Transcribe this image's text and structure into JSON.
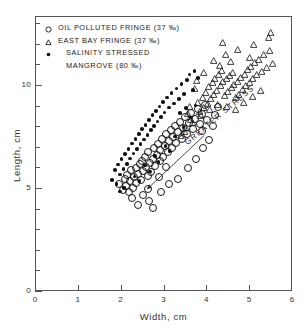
{
  "chart_data": {
    "type": "scatter",
    "title": "",
    "xlabel": "Width, cm",
    "ylabel": "Length, cm",
    "xlim": [
      0,
      6
    ],
    "ylim": [
      0,
      13.35
    ],
    "xticks": [
      0,
      1,
      2,
      3,
      4,
      5,
      6
    ],
    "xticklabels": [
      "0",
      "1",
      "2",
      "3",
      "4",
      "5",
      "6"
    ],
    "yticks": [
      0,
      1,
      2,
      3,
      4,
      5,
      6,
      7,
      8,
      9,
      10,
      11,
      12,
      13
    ],
    "yticklabels_shown": {
      "0": "0",
      "5": "5",
      "10": "10"
    },
    "grid": false,
    "legend_position": "upper-left-inside",
    "annotations": [
      {
        "text": "GREATER STRESS",
        "type": "arrow",
        "angle_deg": -40,
        "tail_xy": [
          3.95,
          7.55
        ],
        "head_xy": [
          2.62,
          4.95
        ]
      }
    ],
    "series": [
      {
        "name": "OIL POLLUTED FRINGE (37 ‰)",
        "marker": "open-circle",
        "color": "#1a1a1a",
        "points": [
          [
            1.92,
            5.3
          ],
          [
            2.0,
            5.02
          ],
          [
            2.05,
            5.55
          ],
          [
            2.08,
            5.2
          ],
          [
            2.1,
            5.72
          ],
          [
            2.14,
            4.92
          ],
          [
            2.18,
            5.45
          ],
          [
            2.2,
            5.95
          ],
          [
            2.24,
            5.12
          ],
          [
            2.26,
            5.62
          ],
          [
            2.3,
            6.05
          ],
          [
            2.32,
            5.35
          ],
          [
            2.36,
            5.8
          ],
          [
            2.4,
            6.25
          ],
          [
            2.42,
            5.5
          ],
          [
            2.45,
            6.42
          ],
          [
            2.48,
            5.92
          ],
          [
            2.52,
            6.6
          ],
          [
            2.55,
            6.1
          ],
          [
            2.58,
            5.68
          ],
          [
            2.6,
            6.85
          ],
          [
            2.64,
            6.3
          ],
          [
            2.66,
            5.88
          ],
          [
            2.7,
            6.52
          ],
          [
            2.72,
            7.05
          ],
          [
            2.76,
            6.18
          ],
          [
            2.8,
            6.72
          ],
          [
            2.82,
            7.25
          ],
          [
            2.86,
            6.4
          ],
          [
            2.88,
            6.95
          ],
          [
            2.92,
            7.48
          ],
          [
            2.95,
            6.62
          ],
          [
            2.98,
            7.15
          ],
          [
            3.02,
            7.7
          ],
          [
            3.05,
            6.85
          ],
          [
            3.08,
            7.38
          ],
          [
            3.12,
            7.9
          ],
          [
            3.15,
            7.05
          ],
          [
            3.18,
            7.58
          ],
          [
            3.22,
            8.12
          ],
          [
            3.25,
            7.28
          ],
          [
            3.3,
            7.8
          ],
          [
            3.34,
            8.32
          ],
          [
            3.38,
            7.5
          ],
          [
            3.42,
            8.02
          ],
          [
            3.46,
            8.52
          ],
          [
            3.5,
            7.72
          ],
          [
            3.55,
            8.25
          ],
          [
            3.6,
            8.72
          ],
          [
            3.64,
            7.95
          ],
          [
            3.7,
            8.45
          ],
          [
            3.75,
            8.95
          ],
          [
            3.8,
            8.18
          ],
          [
            3.86,
            8.68
          ],
          [
            3.92,
            9.15
          ],
          [
            2.22,
            4.6
          ],
          [
            2.48,
            4.78
          ],
          [
            2.62,
            4.45
          ],
          [
            2.9,
            4.88
          ],
          [
            3.08,
            5.3
          ],
          [
            3.3,
            5.55
          ],
          [
            3.52,
            6.08
          ],
          [
            3.72,
            6.5
          ],
          [
            3.88,
            7.02
          ],
          [
            4.02,
            7.45
          ],
          [
            4.1,
            8.1
          ],
          [
            4.16,
            8.62
          ],
          [
            4.22,
            9.05
          ],
          [
            3.98,
            8.38
          ],
          [
            3.86,
            7.88
          ],
          [
            2.36,
            4.28
          ],
          [
            2.7,
            4.15
          ],
          [
            2.58,
            5.05
          ],
          [
            2.84,
            5.62
          ],
          [
            3.0,
            6.1
          ]
        ]
      },
      {
        "name": "EAST BAY FRINGE (37 ‰)",
        "marker": "open-triangle",
        "color": "#1a1a1a",
        "points": [
          [
            3.55,
            9.0
          ],
          [
            3.58,
            9.35
          ],
          [
            3.62,
            8.7
          ],
          [
            3.78,
            9.55
          ],
          [
            3.82,
            9.1
          ],
          [
            3.88,
            9.8
          ],
          [
            3.92,
            9.28
          ],
          [
            3.96,
            10.05
          ],
          [
            4.0,
            9.5
          ],
          [
            4.04,
            10.3
          ],
          [
            4.08,
            9.72
          ],
          [
            4.12,
            10.5
          ],
          [
            4.14,
            9.95
          ],
          [
            4.18,
            10.72
          ],
          [
            4.22,
            10.15
          ],
          [
            4.26,
            10.92
          ],
          [
            4.3,
            10.35
          ],
          [
            4.34,
            11.1
          ],
          [
            4.36,
            10.55
          ],
          [
            4.4,
            9.9
          ],
          [
            4.44,
            10.7
          ],
          [
            4.48,
            10.1
          ],
          [
            4.52,
            10.85
          ],
          [
            4.56,
            10.25
          ],
          [
            4.6,
            11.0
          ],
          [
            4.62,
            10.42
          ],
          [
            4.66,
            9.78
          ],
          [
            4.7,
            10.58
          ],
          [
            4.74,
            9.95
          ],
          [
            4.78,
            10.75
          ],
          [
            4.82,
            10.18
          ],
          [
            4.86,
            10.9
          ],
          [
            4.9,
            10.35
          ],
          [
            4.94,
            11.15
          ],
          [
            4.98,
            10.52
          ],
          [
            5.02,
            11.3
          ],
          [
            5.06,
            10.7
          ],
          [
            5.1,
            11.48
          ],
          [
            5.14,
            10.88
          ],
          [
            5.2,
            11.65
          ],
          [
            5.26,
            11.05
          ],
          [
            5.32,
            11.85
          ],
          [
            5.38,
            11.25
          ],
          [
            5.46,
            12.05
          ],
          [
            5.52,
            11.45
          ],
          [
            4.15,
            11.6
          ],
          [
            4.42,
            11.85
          ],
          [
            4.7,
            12.1
          ],
          [
            4.98,
            11.72
          ],
          [
            5.08,
            12.35
          ],
          [
            3.7,
            10.2
          ],
          [
            3.74,
            10.62
          ],
          [
            3.92,
            11.02
          ],
          [
            4.28,
            11.35
          ],
          [
            4.55,
            11.55
          ],
          [
            3.5,
            8.35
          ],
          [
            3.66,
            8.55
          ],
          [
            3.84,
            8.9
          ],
          [
            4.05,
            9.18
          ],
          [
            4.25,
            9.45
          ],
          [
            4.45,
            9.35
          ],
          [
            4.65,
            9.22
          ],
          [
            4.85,
            9.55
          ],
          [
            5.05,
            9.85
          ],
          [
            5.25,
            10.15
          ],
          [
            3.38,
            7.95
          ],
          [
            3.46,
            8.15
          ],
          [
            4.35,
            12.45
          ],
          [
            5.42,
            12.7
          ],
          [
            5.48,
            12.95
          ]
        ]
      },
      {
        "name": "SALINITY STRESSED MANGROVE (80 ‰)",
        "marker": "filled-circle",
        "color": "#111111",
        "points": [
          [
            1.78,
            5.45
          ],
          [
            1.84,
            5.92
          ],
          [
            1.88,
            5.25
          ],
          [
            1.92,
            6.18
          ],
          [
            1.96,
            5.7
          ],
          [
            2.0,
            6.45
          ],
          [
            2.04,
            5.98
          ],
          [
            2.08,
            6.7
          ],
          [
            2.12,
            6.22
          ],
          [
            2.16,
            6.95
          ],
          [
            2.2,
            6.48
          ],
          [
            2.24,
            7.2
          ],
          [
            2.28,
            6.72
          ],
          [
            2.32,
            7.42
          ],
          [
            2.36,
            6.95
          ],
          [
            2.4,
            7.68
          ],
          [
            2.44,
            7.18
          ],
          [
            2.48,
            7.9
          ],
          [
            2.52,
            7.4
          ],
          [
            2.56,
            8.12
          ],
          [
            2.6,
            7.62
          ],
          [
            2.64,
            8.35
          ],
          [
            2.68,
            7.85
          ],
          [
            2.72,
            8.58
          ],
          [
            2.76,
            8.05
          ],
          [
            2.8,
            8.8
          ],
          [
            2.84,
            8.28
          ],
          [
            2.88,
            9.0
          ],
          [
            2.92,
            8.5
          ],
          [
            2.96,
            9.22
          ],
          [
            3.0,
            8.72
          ],
          [
            3.06,
            9.45
          ],
          [
            3.1,
            8.95
          ],
          [
            3.16,
            9.65
          ],
          [
            3.22,
            9.15
          ],
          [
            3.28,
            9.88
          ],
          [
            3.34,
            9.38
          ],
          [
            3.4,
            10.1
          ],
          [
            3.46,
            9.6
          ],
          [
            3.52,
            10.3
          ],
          [
            2.05,
            5.05
          ],
          [
            2.3,
            5.6
          ],
          [
            2.55,
            6.15
          ],
          [
            2.78,
            6.6
          ],
          [
            3.02,
            7.1
          ],
          [
            3.24,
            7.55
          ],
          [
            3.44,
            8.0
          ],
          [
            3.62,
            8.48
          ],
          [
            3.72,
            9.05
          ],
          [
            3.58,
            10.55
          ],
          [
            1.96,
            4.88
          ],
          [
            2.42,
            5.38
          ],
          [
            2.66,
            5.85
          ],
          [
            2.86,
            6.32
          ],
          [
            3.12,
            6.85
          ],
          [
            3.36,
            8.7
          ],
          [
            3.5,
            8.92
          ],
          [
            3.66,
            9.82
          ],
          [
            3.78,
            10.4
          ],
          [
            3.7,
            10.72
          ]
        ]
      }
    ]
  },
  "legend": {
    "entries": [
      {
        "symbol": "open-circle",
        "label": "OIL POLLUTED  FRINGE  (37 ‰)"
      },
      {
        "symbol": "open-triangle",
        "label": "EAST BAY  FRINGE  (37 ‰)"
      },
      {
        "symbol": "filled-circle",
        "label": "SALINITY  STRESSED",
        "label2": "MANGROVE  (80 ‰)"
      }
    ]
  },
  "axes": {
    "x_title": "Width, cm",
    "y_title": "Length, cm"
  }
}
